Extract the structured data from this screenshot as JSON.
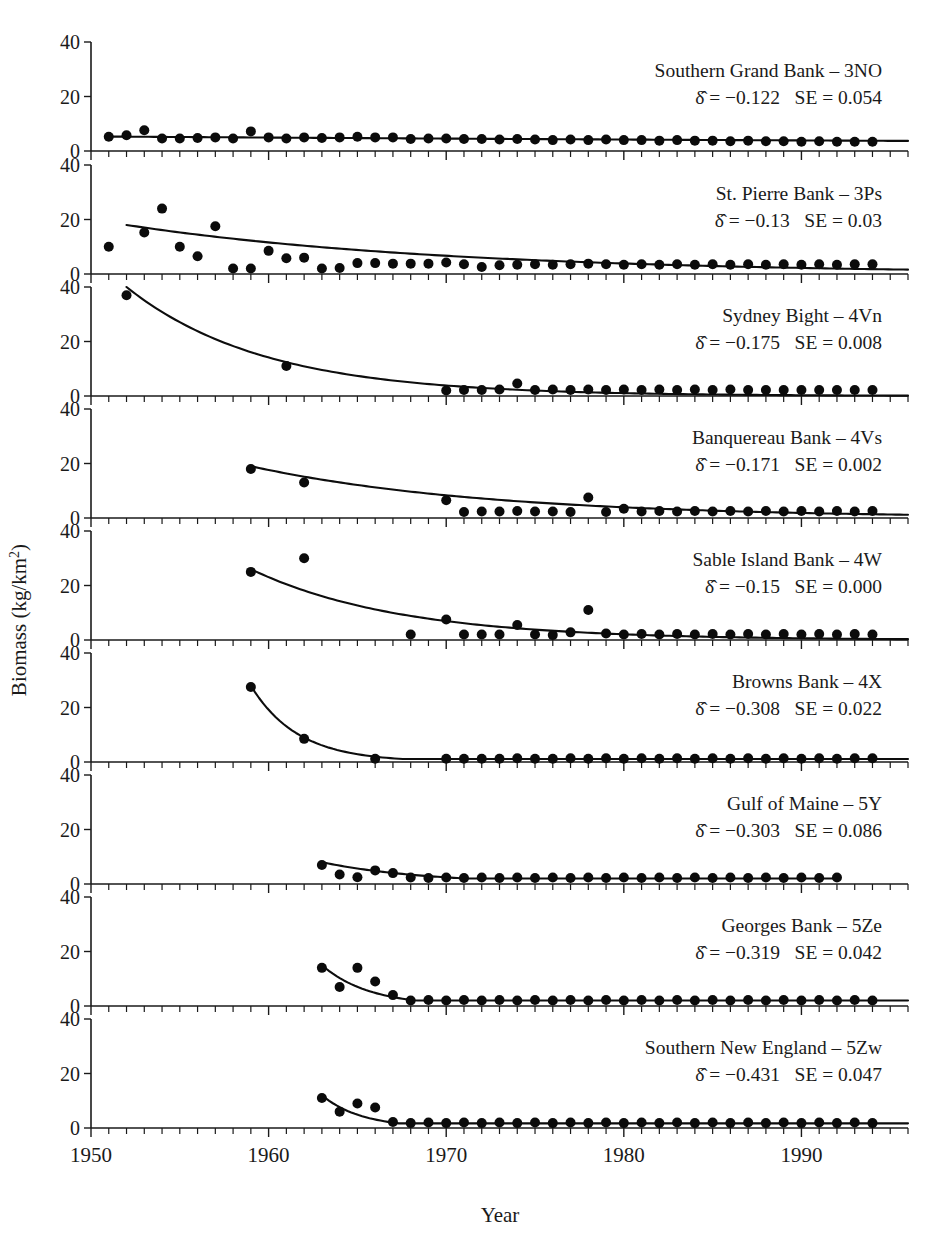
{
  "figure": {
    "xlabel": "Year",
    "ylabel_main": "Biomass (kg/km",
    "ylabel_sup": "2",
    "ylabel_tail": ")",
    "ylabel_full": "Biomass (kg/km2)",
    "x_tick_labels": [
      "1950",
      "1960",
      "1970",
      "1980",
      "1990"
    ],
    "x_tick_values": [
      1950,
      1960,
      1970,
      1980,
      1990
    ],
    "y_tick_labels": [
      "0",
      "20",
      "40"
    ],
    "y_tick_values": [
      0,
      20,
      40
    ],
    "xlim": [
      1950,
      1996
    ],
    "ylim": [
      0,
      40
    ],
    "point_color": "#0b0b0b",
    "line_color": "#0d0d0d",
    "background": "#ffffff"
  },
  "chart_data": {
    "type": "scatter",
    "title": "",
    "xlabel": "Year",
    "ylabel": "Biomass (kg/km2)",
    "xlim": [
      1950,
      1996
    ],
    "ylim": [
      0,
      40
    ],
    "grid": false,
    "legend": "none",
    "panel_layout": "9 rows x 1 column, shared x-axis",
    "series_note": "Each panel: filled circles = observed biomass; solid curve = fitted exponential decline",
    "panels": [
      {
        "name": "Southern Grand Bank – 3NO",
        "region_label": "Southern Grand Bank",
        "region_code": "3NO",
        "delta_label": "δ",
        "delta_value": "−0.122",
        "se_label": "SE",
        "se_value": "0.054",
        "x": [
          1951,
          1952,
          1953,
          1954,
          1955,
          1956,
          1957,
          1958,
          1959,
          1960,
          1961,
          1962,
          1963,
          1964,
          1965,
          1966,
          1967,
          1968,
          1969,
          1970,
          1971,
          1972,
          1973,
          1974,
          1975,
          1976,
          1977,
          1978,
          1979,
          1980,
          1981,
          1982,
          1983,
          1984,
          1985,
          1986,
          1987,
          1988,
          1989,
          1990,
          1991,
          1992,
          1993,
          1994
        ],
        "y": [
          5.2,
          5.8,
          7.6,
          4.6,
          4.6,
          4.8,
          5.0,
          4.6,
          7.2,
          5.0,
          4.6,
          5.0,
          4.8,
          5.0,
          5.2,
          5.0,
          5.0,
          4.4,
          4.6,
          4.6,
          4.4,
          4.4,
          4.2,
          4.4,
          4.2,
          4.0,
          4.2,
          4.0,
          4.2,
          4.0,
          4.0,
          3.8,
          4.0,
          3.8,
          3.8,
          3.6,
          3.8,
          3.6,
          3.6,
          3.4,
          3.6,
          3.4,
          3.4,
          3.4
        ],
        "fit": {
          "a": 5.3,
          "b": 0.008,
          "x0": 1951,
          "x1": 1996
        }
      },
      {
        "name": "St. Pierre Bank – 3Ps",
        "region_label": "St. Pierre Bank",
        "region_code": "3Ps",
        "delta_label": "δ",
        "delta_value": "−0.13",
        "se_label": "SE",
        "se_value": "0.03",
        "x": [
          1951,
          1953,
          1954,
          1955,
          1956,
          1957,
          1958,
          1959,
          1960,
          1961,
          1962,
          1963,
          1964,
          1965,
          1966,
          1967,
          1968,
          1969,
          1970,
          1971,
          1972,
          1973,
          1974,
          1975,
          1976,
          1977,
          1978,
          1979,
          1980,
          1981,
          1982,
          1983,
          1984,
          1985,
          1986,
          1987,
          1988,
          1989,
          1990,
          1991,
          1992,
          1993,
          1994
        ],
        "y": [
          10.0,
          15.2,
          24.0,
          10.0,
          6.5,
          17.5,
          2.0,
          2.0,
          8.5,
          5.8,
          6.0,
          2.0,
          2.2,
          4.0,
          4.0,
          3.8,
          3.8,
          3.8,
          4.2,
          3.6,
          2.6,
          3.2,
          3.4,
          3.6,
          3.4,
          3.6,
          3.8,
          3.6,
          3.4,
          3.6,
          3.4,
          3.6,
          3.4,
          3.6,
          3.4,
          3.6,
          3.4,
          3.6,
          3.4,
          3.6,
          3.4,
          3.6,
          3.6
        ],
        "fit": {
          "a": 18.0,
          "b": 0.055,
          "x0": 1952,
          "x1": 1996
        }
      },
      {
        "name": "Sydney Bight – 4Vn",
        "region_label": "Sydney Bight",
        "region_code": "4Vn",
        "delta_label": "δ",
        "delta_value": "−0.175",
        "se_label": "SE",
        "se_value": "0.008",
        "x": [
          1952,
          1961,
          1970,
          1971,
          1972,
          1973,
          1974,
          1975,
          1976,
          1977,
          1978,
          1979,
          1980,
          1981,
          1982,
          1983,
          1984,
          1985,
          1986,
          1987,
          1988,
          1989,
          1990,
          1991,
          1992,
          1993,
          1994
        ],
        "y": [
          37.0,
          11.0,
          2.0,
          2.2,
          2.2,
          2.4,
          4.6,
          2.2,
          2.4,
          2.2,
          2.4,
          2.2,
          2.4,
          2.2,
          2.4,
          2.2,
          2.4,
          2.2,
          2.4,
          2.2,
          2.2,
          2.2,
          2.2,
          2.2,
          2.2,
          2.2,
          2.2
        ],
        "fit": {
          "a": 40.0,
          "b": 0.13,
          "x0": 1952,
          "x1": 1996
        }
      },
      {
        "name": "Banquereau Bank – 4Vs",
        "region_label": "Banquereau Bank",
        "region_code": "4Vs",
        "delta_label": "δ",
        "delta_value": "−0.171",
        "se_label": "SE",
        "se_value": "0.002",
        "x": [
          1959,
          1962,
          1970,
          1971,
          1972,
          1973,
          1974,
          1975,
          1976,
          1977,
          1978,
          1979,
          1980,
          1981,
          1982,
          1983,
          1984,
          1985,
          1986,
          1987,
          1988,
          1989,
          1990,
          1991,
          1992,
          1993,
          1994
        ],
        "y": [
          18.0,
          13.0,
          6.5,
          2.2,
          2.4,
          2.4,
          2.6,
          2.4,
          2.4,
          2.2,
          7.5,
          2.2,
          3.4,
          2.4,
          2.6,
          2.4,
          2.6,
          2.4,
          2.6,
          2.4,
          2.6,
          2.4,
          2.6,
          2.4,
          2.6,
          2.4,
          2.6
        ],
        "fit": {
          "a": 19.0,
          "b": 0.075,
          "x0": 1959,
          "x1": 1996
        }
      },
      {
        "name": "Sable Island Bank – 4W",
        "region_label": "Sable Island Bank",
        "region_code": "4W",
        "delta_label": "δ",
        "delta_value": "−0.15",
        "se_label": "SE",
        "se_value": "0.000",
        "x": [
          1959,
          1962,
          1968,
          1970,
          1971,
          1972,
          1973,
          1974,
          1975,
          1976,
          1977,
          1978,
          1979,
          1980,
          1981,
          1982,
          1983,
          1984,
          1985,
          1986,
          1987,
          1988,
          1989,
          1990,
          1991,
          1992,
          1993,
          1994
        ],
        "y": [
          25.0,
          30.0,
          2.0,
          7.5,
          2.0,
          2.0,
          2.0,
          5.5,
          2.0,
          1.8,
          2.8,
          11.0,
          2.4,
          2.0,
          2.2,
          2.0,
          2.2,
          2.0,
          2.2,
          2.0,
          2.2,
          2.0,
          2.2,
          2.0,
          2.2,
          2.0,
          2.2,
          2.0
        ],
        "fit": {
          "a": 26.0,
          "b": 0.12,
          "x0": 1959,
          "x1": 1996
        }
      },
      {
        "name": "Browns Bank – 4X",
        "region_label": "Browns Bank",
        "region_code": "4X",
        "delta_label": "δ",
        "delta_value": "−0.308",
        "se_label": "SE",
        "se_value": "0.022",
        "x": [
          1959,
          1962,
          1966,
          1970,
          1971,
          1972,
          1973,
          1974,
          1975,
          1976,
          1977,
          1978,
          1979,
          1980,
          1981,
          1982,
          1983,
          1984,
          1985,
          1986,
          1987,
          1988,
          1989,
          1990,
          1991,
          1992,
          1993,
          1994
        ],
        "y": [
          27.5,
          8.5,
          1.2,
          1.2,
          1.2,
          1.2,
          1.2,
          1.4,
          1.2,
          1.2,
          1.4,
          1.2,
          1.4,
          1.2,
          1.4,
          1.2,
          1.4,
          1.2,
          1.4,
          1.2,
          1.4,
          1.2,
          1.4,
          1.2,
          1.4,
          1.2,
          1.4,
          1.4
        ],
        "fit": {
          "a": 28.0,
          "b": 0.38,
          "x0": 1959,
          "x1": 1996,
          "floor": 1.1
        }
      },
      {
        "name": "Gulf of Maine – 5Y",
        "region_label": "Gulf of Maine",
        "region_code": "5Y",
        "delta_label": "δ",
        "delta_value": "−0.303",
        "se_label": "SE",
        "se_value": "0.086",
        "x": [
          1963,
          1964,
          1965,
          1966,
          1967,
          1968,
          1969,
          1970,
          1971,
          1972,
          1973,
          1974,
          1975,
          1976,
          1977,
          1978,
          1979,
          1980,
          1981,
          1982,
          1983,
          1984,
          1985,
          1986,
          1987,
          1988,
          1989,
          1990,
          1991,
          1992
        ],
        "y": [
          7.0,
          3.5,
          2.5,
          5.0,
          4.0,
          2.4,
          2.2,
          2.4,
          2.2,
          2.4,
          2.2,
          2.4,
          2.2,
          2.4,
          2.2,
          2.4,
          2.2,
          2.4,
          2.2,
          2.4,
          2.2,
          2.4,
          2.2,
          2.4,
          2.2,
          2.4,
          2.2,
          2.4,
          2.2,
          2.4
        ],
        "fit": {
          "a": 8.0,
          "b": 0.17,
          "x0": 1963,
          "x1": 1992,
          "floor": 2.0
        }
      },
      {
        "name": "Georges Bank – 5Ze",
        "region_label": "Georges Bank",
        "region_code": "5Ze",
        "delta_label": "δ",
        "delta_value": "−0.319",
        "se_label": "SE",
        "se_value": "0.042",
        "x": [
          1963,
          1964,
          1965,
          1966,
          1967,
          1968,
          1969,
          1970,
          1971,
          1972,
          1973,
          1974,
          1975,
          1976,
          1977,
          1978,
          1979,
          1980,
          1981,
          1982,
          1983,
          1984,
          1985,
          1986,
          1987,
          1988,
          1989,
          1990,
          1991,
          1992,
          1993,
          1994
        ],
        "y": [
          14.0,
          7.0,
          14.0,
          9.0,
          4.0,
          2.0,
          2.2,
          2.0,
          2.2,
          2.0,
          2.2,
          2.0,
          2.2,
          2.0,
          2.2,
          2.0,
          2.2,
          2.0,
          2.2,
          2.0,
          2.2,
          2.0,
          2.2,
          2.0,
          2.2,
          2.0,
          2.2,
          2.0,
          2.2,
          2.0,
          2.2,
          2.0
        ],
        "fit": {
          "a": 15.0,
          "b": 0.38,
          "x0": 1963,
          "x1": 1996,
          "floor": 2.0
        }
      },
      {
        "name": "Southern New England – 5Zw",
        "region_label": "Southern New England",
        "region_code": "5Zw",
        "delta_label": "δ",
        "delta_value": "−0.431",
        "se_label": "SE",
        "se_value": "0.047",
        "x": [
          1963,
          1964,
          1965,
          1966,
          1967,
          1968,
          1969,
          1970,
          1971,
          1972,
          1973,
          1974,
          1975,
          1976,
          1977,
          1978,
          1979,
          1980,
          1981,
          1982,
          1983,
          1984,
          1985,
          1986,
          1987,
          1988,
          1989,
          1990,
          1991,
          1992,
          1993,
          1994
        ],
        "y": [
          11.0,
          6.0,
          9.0,
          7.5,
          2.2,
          1.8,
          2.0,
          1.8,
          2.0,
          1.8,
          2.0,
          1.8,
          2.0,
          1.8,
          2.0,
          1.8,
          2.0,
          1.8,
          2.0,
          1.8,
          2.0,
          1.8,
          2.0,
          1.8,
          2.0,
          1.8,
          2.0,
          1.8,
          2.0,
          1.8,
          2.0,
          1.8
        ],
        "fit": {
          "a": 12.0,
          "b": 0.45,
          "x0": 1963,
          "x1": 1996,
          "floor": 1.7
        }
      }
    ]
  }
}
